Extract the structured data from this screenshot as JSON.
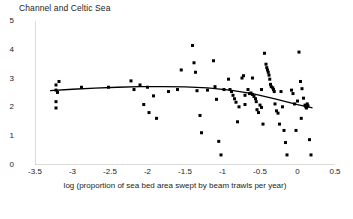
{
  "chart_data": {
    "type": "scatter",
    "title": "Channel and Celtic Sea",
    "xlabel": "log (proportion of sea bed area swept by beam trawls per year)",
    "ylabel": "log (starfish catch numbers)",
    "xlim": [
      -3.5,
      0.5
    ],
    "ylim": [
      0,
      5
    ],
    "xticks": [
      -3.5,
      -3,
      -2.5,
      -2,
      -1.5,
      -1,
      -0.5,
      0,
      0.5
    ],
    "xticklabels": [
      "-3.5",
      "-3",
      "-2.5",
      "-2",
      "-1.5",
      "-1",
      "-0.5",
      "0",
      "0.5"
    ],
    "yticks": [
      0,
      1,
      2,
      3,
      4,
      5
    ],
    "yticklabels": [
      "0",
      "1",
      "2",
      "3",
      "4",
      "5"
    ],
    "grid": false,
    "legend": null,
    "marker": {
      "shape": "square",
      "color": "#000000",
      "size_px": 3
    },
    "points": [
      [
        -3.22,
        2.78
      ],
      [
        -3.22,
        2.6
      ],
      [
        -3.2,
        2.52
      ],
      [
        -3.22,
        2.2
      ],
      [
        -3.22,
        1.98
      ],
      [
        -3.18,
        2.9
      ],
      [
        -2.88,
        2.7
      ],
      [
        -2.22,
        2.92
      ],
      [
        -2.18,
        2.62
      ],
      [
        -2.1,
        2.78
      ],
      [
        -2.05,
        2.1
      ],
      [
        -2.0,
        2.7
      ],
      [
        -1.98,
        1.82
      ],
      [
        -1.92,
        2.4
      ],
      [
        -1.88,
        1.62
      ],
      [
        -1.55,
        3.3
      ],
      [
        -1.4,
        4.15
      ],
      [
        -1.38,
        3.55
      ],
      [
        -1.36,
        3.22
      ],
      [
        -1.34,
        2.58
      ],
      [
        -1.3,
        1.72
      ],
      [
        -1.28,
        1.12
      ],
      [
        -1.12,
        3.62
      ],
      [
        -1.1,
        2.72
      ],
      [
        -1.08,
        2.28
      ],
      [
        -1.05,
        0.82
      ],
      [
        -1.02,
        0.35
      ],
      [
        -0.92,
        2.98
      ],
      [
        -0.9,
        2.62
      ],
      [
        -0.88,
        2.55
      ],
      [
        -0.86,
        2.42
      ],
      [
        -0.84,
        2.3
      ],
      [
        -0.82,
        2.18
      ],
      [
        -0.8,
        1.5
      ],
      [
        -0.78,
        2.02
      ],
      [
        -0.74,
        3.02
      ],
      [
        -0.72,
        3.1
      ],
      [
        -0.7,
        2.42
      ],
      [
        -0.66,
        2.62
      ],
      [
        -0.64,
        2.48
      ],
      [
        -0.62,
        2.5
      ],
      [
        -0.6,
        2.45
      ],
      [
        -0.58,
        2.38
      ],
      [
        -0.56,
        2.3
      ],
      [
        -0.55,
        2.2
      ],
      [
        -0.54,
        1.92
      ],
      [
        -0.52,
        1.82
      ],
      [
        -0.5,
        2.08
      ],
      [
        -0.48,
        2.0
      ],
      [
        -0.46,
        1.42
      ],
      [
        -0.44,
        3.88
      ],
      [
        -0.42,
        3.5
      ],
      [
        -0.41,
        3.38
      ],
      [
        -0.4,
        3.3
      ],
      [
        -0.39,
        3.22
      ],
      [
        -0.38,
        3.12
      ],
      [
        -0.37,
        2.98
      ],
      [
        -0.36,
        2.8
      ],
      [
        -0.35,
        2.72
      ],
      [
        -0.33,
        2.68
      ],
      [
        -0.32,
        2.62
      ],
      [
        -0.31,
        2.55
      ],
      [
        -0.3,
        2.12
      ],
      [
        -0.28,
        1.88
      ],
      [
        -0.26,
        1.8
      ],
      [
        -0.24,
        1.42
      ],
      [
        -0.22,
        2.55
      ],
      [
        -0.2,
        2.02
      ],
      [
        -0.18,
        1.2
      ],
      [
        -0.16,
        0.78
      ],
      [
        -0.14,
        0.35
      ],
      [
        -0.08,
        2.6
      ],
      [
        -0.06,
        2.48
      ],
      [
        -0.04,
        2.12
      ],
      [
        -0.02,
        1.2
      ],
      [
        0.02,
        3.92
      ],
      [
        0.04,
        2.9
      ],
      [
        0.06,
        2.65
      ],
      [
        0.08,
        2.32
      ],
      [
        0.1,
        2.08
      ],
      [
        0.11,
        2.02
      ],
      [
        0.12,
        1.98
      ],
      [
        0.13,
        2.12
      ],
      [
        0.14,
        2.05
      ],
      [
        0.16,
        0.88
      ],
      [
        0.18,
        0.35
      ],
      [
        -2.52,
        2.7
      ],
      [
        -1.72,
        2.55
      ],
      [
        -1.6,
        2.62
      ],
      [
        -1.2,
        2.6
      ],
      [
        -0.98,
        2.62
      ],
      [
        -0.7,
        2.1
      ],
      [
        -0.6,
        3.02
      ],
      [
        -0.48,
        2.62
      ],
      [
        0.0,
        2.22
      ],
      [
        0.05,
        1.62
      ]
    ],
    "fit_curve": {
      "name": "smoothed fit",
      "color": "#000000",
      "x": [
        -3.3,
        -3.0,
        -2.7,
        -2.4,
        -2.1,
        -1.8,
        -1.5,
        -1.2,
        -0.9,
        -0.6,
        -0.3,
        0.0,
        0.2
      ],
      "y": [
        2.58,
        2.63,
        2.67,
        2.7,
        2.72,
        2.72,
        2.71,
        2.68,
        2.6,
        2.48,
        2.3,
        2.1,
        1.98
      ]
    }
  }
}
